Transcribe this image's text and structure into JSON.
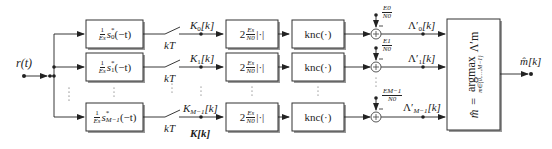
{
  "diagram": {
    "input": {
      "label": "r(t)"
    },
    "output": {
      "label": "m̂[k]"
    },
    "vector_label": "K[k]",
    "sampler_label": "kT",
    "rows": [
      {
        "matched_filter": {
          "prefix": "1",
          "energy": "Es",
          "signal": "s",
          "index": "0",
          "suffix": "(−t)"
        },
        "sample_label": "K0[k]",
        "sample_main": "K",
        "sample_sub": "0",
        "sample_tail": "[k]",
        "scale": {
          "coef": "2",
          "num": "Es",
          "den": "N0",
          "op": "|·|"
        },
        "nonlin": "knc(·)",
        "bias": {
          "num": "E0",
          "den": "N0",
          "sign": "−"
        },
        "metric_main": "Λ′",
        "metric_sub": "0",
        "metric_tail": "[k]"
      },
      {
        "matched_filter": {
          "prefix": "1",
          "energy": "Es",
          "signal": "s",
          "index": "1",
          "suffix": "(−t)"
        },
        "sample_main": "K",
        "sample_sub": "1",
        "sample_tail": "[k]",
        "scale": {
          "coef": "2",
          "num": "Es",
          "den": "N0",
          "op": "|·|"
        },
        "nonlin": "knc(·)",
        "bias": {
          "num": "E1",
          "den": "N0",
          "sign": "−"
        },
        "metric_main": "Λ′",
        "metric_sub": "1",
        "metric_tail": "[k]"
      },
      {
        "matched_filter": {
          "prefix": "1",
          "energy": "Es",
          "signal": "s",
          "index": "M−1",
          "suffix": "(−t)"
        },
        "sample_main": "K",
        "sample_sub": "M−1",
        "sample_tail": "[k]",
        "scale": {
          "coef": "2",
          "num": "Es",
          "den": "N0",
          "op": "|·|"
        },
        "nonlin": "knc(·)",
        "bias": {
          "num": "EM−1",
          "den": "N0",
          "sign": "−"
        },
        "metric_main": "Λ′",
        "metric_sub": "M−1",
        "metric_tail": "[k]"
      }
    ],
    "decision": {
      "lhs": "m̂",
      "eq": "=",
      "op": "argmax",
      "arg": "Λ′m",
      "range": "m∈{0,…,M−1}"
    },
    "colors": {
      "line": "#222222",
      "box_border": "#333333",
      "box_shadow": "#9a9a9a",
      "background": "#ffffff"
    }
  }
}
